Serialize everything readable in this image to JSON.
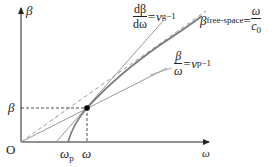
{
  "diagram": {
    "type": "dispersion-relation",
    "axes": {
      "y_label": "β",
      "x_label": "ω",
      "origin_label": "O"
    },
    "point": {
      "beta_label": "β",
      "omega_label": "ω",
      "omega_p_label": "ω",
      "omega_p_sub": "p"
    },
    "group_velocity_label": {
      "num": "dβ",
      "den": "dω",
      "rhs": "=v",
      "sub": "g",
      "sup": "−1"
    },
    "free_space_label": {
      "lhs": "β",
      "sub": "free-space",
      "eq": "=",
      "num": "ω",
      "den": "c",
      "den_sub": "0"
    },
    "phase_velocity_label": {
      "num": "β",
      "den": "ω",
      "rhs": "=v",
      "sub": "p",
      "sup": "−1"
    },
    "colors": {
      "axis": "#222222",
      "curve": "#777777",
      "lines": "#999999",
      "dashed": "#999999",
      "point": "#000000"
    }
  }
}
